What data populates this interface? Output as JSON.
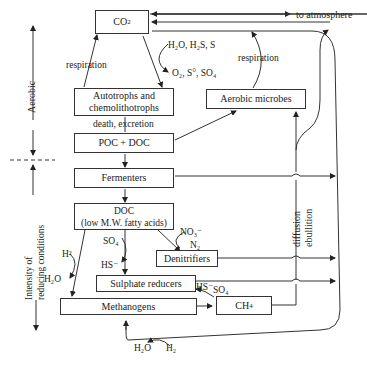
{
  "axis": {
    "aerobic_label": "Aerobic",
    "reducing_label_line1": "Intensity of",
    "reducing_label_line2": "reducing conditions"
  },
  "nodes": {
    "co2": "CO",
    "co2_sub": "2",
    "autotrophs_line1": "Autotrophs and",
    "autotrophs_line2": "chemolithotrophs",
    "aerobic_microbes": "Aerobic microbes",
    "poc_doc": "POC + DOC",
    "fermenters": "Fermenters",
    "doc_line1": "DOC",
    "doc_line2": "(low M.W. fatty acids)",
    "denitrifiers": "Denitrifiers",
    "sulphate_reducers": "Sulphate reducers",
    "methanogens": "Methanogens",
    "ch4": "CH",
    "ch4_sub": "4"
  },
  "labels": {
    "to_atmosphere": "to atmosphere",
    "respiration_left": "respiration",
    "respiration_right": "respiration",
    "death_excretion": "death, excretion",
    "h2o_h2s_s": "H₂O, H₂S, S",
    "o2_s_so4": "O₂, S°, SO₄",
    "no3": "NO₃⁻",
    "n2": "N₂",
    "so4_left": "SO₄",
    "hs_left": "HS⁻",
    "h2_left": "H²",
    "h2o_left": "H₂O",
    "hs_right": "HS⁻",
    "so4_right": "SO₄",
    "h2o_bottom": "H₂O",
    "h2_bottom": "H₂",
    "diffusion": "diffusion",
    "ebullition": "ebullition"
  }
}
